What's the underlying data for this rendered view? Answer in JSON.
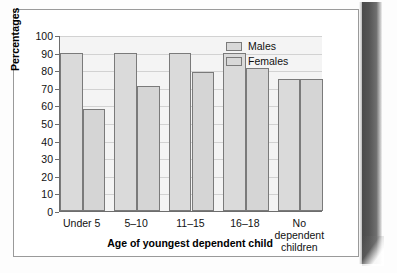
{
  "chart_data": {
    "type": "bar",
    "title": "",
    "subtitle": "",
    "xlabel": "Age of youngest dependent child",
    "ylabel": "Percentages",
    "categories": [
      "Under 5",
      "5–10",
      "11–15",
      "16–18",
      "No dependent\nchildren"
    ],
    "series": [
      {
        "name": "Males",
        "values": [
          90,
          90,
          90,
          90,
          75
        ]
      },
      {
        "name": "Females",
        "values": [
          58,
          71,
          79,
          81,
          75
        ]
      }
    ],
    "ylim": [
      0,
      100
    ],
    "ytick_labels": [
      "100",
      "90",
      "80",
      "70",
      "60",
      "50",
      "40",
      "30",
      "20",
      "10",
      "0"
    ],
    "ytick_values": [
      100,
      90,
      80,
      70,
      60,
      50,
      40,
      30,
      20,
      10,
      0
    ],
    "grid": true,
    "grid_axis": "y",
    "legend_position": "top-right",
    "colors": {
      "males_fill": "#dadada",
      "females_fill": "#d5d5d5",
      "bar_outline": "#7a7a7a",
      "plot_background": "#f4f4f4",
      "gridline": "#d2d2d2",
      "axis": "#6d6d6d",
      "text": "#111111"
    }
  },
  "legend": {
    "items": [
      {
        "label": "Males"
      },
      {
        "label": "Females"
      }
    ]
  },
  "axes": {
    "y_title": "Percentages",
    "x_title": "Age of youngest dependent child"
  }
}
